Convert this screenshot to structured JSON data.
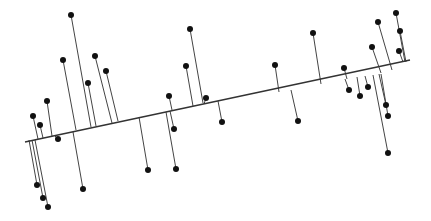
{
  "chart_data": {
    "type": "scatter",
    "title": "",
    "xlabel": "",
    "ylabel": "",
    "grid": false,
    "legend": null,
    "colors": {
      "line": "#333333",
      "point": "#111111",
      "residual": "#444444"
    },
    "regression_line": {
      "x1": 25,
      "y1": 142,
      "x2": 410,
      "y2": 60
    },
    "points": [
      {
        "x": 71,
        "y": 15,
        "fx": 91,
        "fy": 127
      },
      {
        "x": 63,
        "y": 60,
        "fx": 76,
        "fy": 130
      },
      {
        "x": 95,
        "y": 56,
        "fx": 112,
        "fy": 123
      },
      {
        "x": 88,
        "y": 83,
        "fx": 96,
        "fy": 126
      },
      {
        "x": 106,
        "y": 71,
        "fx": 118,
        "fy": 121
      },
      {
        "x": 47,
        "y": 101,
        "fx": 52,
        "fy": 136
      },
      {
        "x": 33,
        "y": 116,
        "fx": 38,
        "fy": 139
      },
      {
        "x": 40,
        "y": 125,
        "fx": 43,
        "fy": 138
      },
      {
        "x": 58,
        "y": 139,
        "fx": 55,
        "fy": 136
      },
      {
        "x": 37,
        "y": 185,
        "fx": 29,
        "fy": 140
      },
      {
        "x": 43,
        "y": 198,
        "fx": 32,
        "fy": 140
      },
      {
        "x": 48,
        "y": 207,
        "fx": 35,
        "fy": 140
      },
      {
        "x": 83,
        "y": 189,
        "fx": 73,
        "fy": 132
      },
      {
        "x": 148,
        "y": 170,
        "fx": 139,
        "fy": 117
      },
      {
        "x": 176,
        "y": 169,
        "fx": 166,
        "fy": 112
      },
      {
        "x": 174,
        "y": 129,
        "fx": 170,
        "fy": 111
      },
      {
        "x": 169,
        "y": 96,
        "fx": 172,
        "fy": 110
      },
      {
        "x": 186,
        "y": 66,
        "fx": 193,
        "fy": 106
      },
      {
        "x": 190,
        "y": 29,
        "fx": 203,
        "fy": 103
      },
      {
        "x": 206,
        "y": 98,
        "fx": 204,
        "fy": 104
      },
      {
        "x": 222,
        "y": 122,
        "fx": 218,
        "fy": 101
      },
      {
        "x": 275,
        "y": 65,
        "fx": 279,
        "fy": 92
      },
      {
        "x": 298,
        "y": 121,
        "fx": 291,
        "fy": 90
      },
      {
        "x": 313,
        "y": 33,
        "fx": 321,
        "fy": 84
      },
      {
        "x": 344,
        "y": 68,
        "fx": 347,
        "fy": 79
      },
      {
        "x": 349,
        "y": 90,
        "fx": 345,
        "fy": 79
      },
      {
        "x": 360,
        "y": 96,
        "fx": 357,
        "fy": 77
      },
      {
        "x": 368,
        "y": 87,
        "fx": 365,
        "fy": 76
      },
      {
        "x": 372,
        "y": 47,
        "fx": 381,
        "fy": 73
      },
      {
        "x": 378,
        "y": 22,
        "fx": 392,
        "fy": 70
      },
      {
        "x": 386,
        "y": 105,
        "fx": 379,
        "fy": 74
      },
      {
        "x": 388,
        "y": 116,
        "fx": 381,
        "fy": 74
      },
      {
        "x": 388,
        "y": 153,
        "fx": 373,
        "fy": 75
      },
      {
        "x": 396,
        "y": 13,
        "fx": 405,
        "fy": 62
      },
      {
        "x": 400,
        "y": 31,
        "fx": 406,
        "fy": 62
      },
      {
        "x": 399,
        "y": 51,
        "fx": 403,
        "fy": 62
      }
    ]
  }
}
